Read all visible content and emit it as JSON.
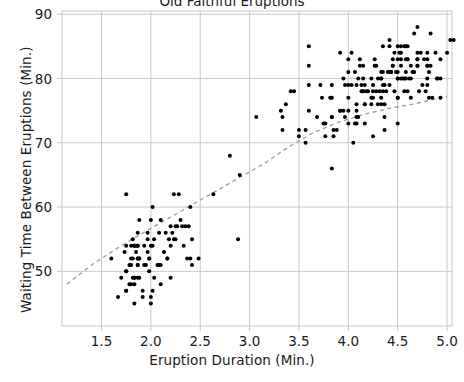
{
  "chart_data": {
    "type": "scatter",
    "title": "Old Faithful Eruptions",
    "xlabel": "Eruption Duration (Min.)",
    "ylabel": "Waiting Time Between Eruptions (Min.)",
    "xlim": [
      1.1,
      5.05
    ],
    "ylim": [
      41.5,
      90.5
    ],
    "xticks": [
      1.5,
      2.0,
      2.5,
      3.0,
      3.5,
      4.0,
      4.5,
      5.0
    ],
    "xticklabels": [
      "1.5",
      "2.0",
      "2.5",
      "3.0",
      "3.5",
      "4.0",
      "4.5",
      "5.0"
    ],
    "yticks": [
      50,
      60,
      70,
      80,
      90
    ],
    "yticklabels": [
      "50",
      "60",
      "70",
      "80",
      "90"
    ],
    "grid": true,
    "grid_color": "#c8c8c8",
    "legend": "none",
    "marker_color": "#000000",
    "marker_size": 4,
    "trend_line": {
      "style": "dashed",
      "color": "#9a9a9a",
      "points": [
        [
          1.15,
          48.0
        ],
        [
          1.4,
          51.0
        ],
        [
          1.65,
          53.5
        ],
        [
          1.9,
          55.8
        ],
        [
          2.15,
          58.0
        ],
        [
          2.4,
          60.2
        ],
        [
          2.65,
          62.4
        ],
        [
          2.9,
          64.6
        ],
        [
          3.15,
          66.8
        ],
        [
          3.4,
          69.4
        ],
        [
          3.65,
          71.6
        ],
        [
          3.9,
          73.2
        ],
        [
          4.15,
          74.4
        ],
        [
          4.4,
          75.3
        ],
        [
          4.65,
          76.0
        ],
        [
          5.0,
          77.2
        ]
      ]
    },
    "points": [
      [
        3.6,
        79
      ],
      [
        1.8,
        54
      ],
      [
        3.333,
        74
      ],
      [
        2.283,
        62
      ],
      [
        4.533,
        85
      ],
      [
        2.883,
        55
      ],
      [
        4.7,
        88
      ],
      [
        3.6,
        85
      ],
      [
        1.95,
        51
      ],
      [
        4.35,
        85
      ],
      [
        1.833,
        54
      ],
      [
        3.917,
        84
      ],
      [
        4.2,
        78
      ],
      [
        1.75,
        47
      ],
      [
        4.7,
        83
      ],
      [
        2.167,
        52
      ],
      [
        1.75,
        62
      ],
      [
        4.8,
        84
      ],
      [
        1.6,
        52
      ],
      [
        4.25,
        79
      ],
      [
        1.8,
        51
      ],
      [
        1.75,
        47
      ],
      [
        3.45,
        78
      ],
      [
        3.067,
        74
      ],
      [
        4.533,
        83
      ],
      [
        3.6,
        82
      ],
      [
        1.967,
        56
      ],
      [
        4.083,
        79
      ],
      [
        3.85,
        71
      ],
      [
        4.433,
        81
      ],
      [
        4.3,
        76
      ],
      [
        4.467,
        78
      ],
      [
        3.367,
        76
      ],
      [
        4.033,
        84
      ],
      [
        3.833,
        74
      ],
      [
        2.017,
        60
      ],
      [
        1.867,
        52
      ],
      [
        4.833,
        87
      ],
      [
        1.833,
        49
      ],
      [
        4.783,
        78
      ],
      [
        4.35,
        79
      ],
      [
        1.883,
        52
      ],
      [
        4.567,
        78
      ],
      [
        1.75,
        50
      ],
      [
        4.533,
        82
      ],
      [
        3.317,
        75
      ],
      [
        3.833,
        79
      ],
      [
        2.1,
        58
      ],
      [
        4.633,
        82
      ],
      [
        2.0,
        54
      ],
      [
        4.8,
        79
      ],
      [
        4.716,
        78
      ],
      [
        1.833,
        54
      ],
      [
        4.833,
        82
      ],
      [
        1.733,
        53
      ],
      [
        4.883,
        84
      ],
      [
        3.717,
        79
      ],
      [
        1.667,
        46
      ],
      [
        4.567,
        80
      ],
      [
        4.317,
        78
      ],
      [
        2.233,
        62
      ],
      [
        4.5,
        81
      ],
      [
        1.75,
        50
      ],
      [
        4.8,
        82
      ],
      [
        1.817,
        52
      ],
      [
        4.4,
        81
      ],
      [
        4.167,
        73
      ],
      [
        4.7,
        84
      ],
      [
        2.067,
        51
      ],
      [
        4.7,
        82
      ],
      [
        4.033,
        79
      ],
      [
        1.967,
        53
      ],
      [
        4.5,
        80
      ],
      [
        4.0,
        83
      ],
      [
        1.983,
        52
      ],
      [
        5.067,
        86
      ],
      [
        2.017,
        54
      ],
      [
        4.567,
        85
      ],
      [
        3.883,
        72
      ],
      [
        3.6,
        75
      ],
      [
        4.133,
        79
      ],
      [
        4.333,
        80
      ],
      [
        4.1,
        74
      ],
      [
        2.633,
        62
      ],
      [
        4.067,
        81
      ],
      [
        4.933,
        77
      ],
      [
        3.95,
        80
      ],
      [
        4.517,
        84
      ],
      [
        2.167,
        52
      ],
      [
        4.0,
        79
      ],
      [
        2.2,
        57
      ],
      [
        4.333,
        77
      ],
      [
        1.867,
        54
      ],
      [
        4.817,
        81
      ],
      [
        1.833,
        45
      ],
      [
        4.3,
        80
      ],
      [
        4.667,
        81
      ],
      [
        3.75,
        73
      ],
      [
        1.867,
        51
      ],
      [
        4.9,
        80
      ],
      [
        2.483,
        52
      ],
      [
        4.367,
        79
      ],
      [
        2.1,
        48
      ],
      [
        4.5,
        80
      ],
      [
        4.05,
        70
      ],
      [
        1.867,
        54
      ],
      [
        4.7,
        82
      ],
      [
        1.783,
        51
      ],
      [
        4.85,
        77
      ],
      [
        3.683,
        74
      ],
      [
        4.733,
        84
      ],
      [
        2.3,
        58
      ],
      [
        4.9,
        80
      ],
      [
        4.417,
        81
      ],
      [
        1.7,
        49
      ],
      [
        4.633,
        77
      ],
      [
        2.317,
        57
      ],
      [
        4.6,
        78
      ],
      [
        1.817,
        55
      ],
      [
        4.417,
        79
      ],
      [
        4.067,
        73
      ],
      [
        4.25,
        77
      ],
      [
        1.967,
        55
      ],
      [
        4.6,
        85
      ],
      [
        3.767,
        73
      ],
      [
        1.917,
        46
      ],
      [
        4.5,
        77
      ],
      [
        2.267,
        57
      ],
      [
        4.65,
        81
      ],
      [
        1.867,
        56
      ],
      [
        4.167,
        79
      ],
      [
        2.8,
        68
      ],
      [
        4.333,
        80
      ],
      [
        1.833,
        49
      ],
      [
        4.383,
        78
      ],
      [
        1.883,
        52
      ],
      [
        4.933,
        80
      ],
      [
        2.033,
        49
      ],
      [
        3.733,
        77
      ],
      [
        4.233,
        76
      ],
      [
        2.233,
        55
      ],
      [
        4.533,
        80
      ],
      [
        4.817,
        77
      ],
      [
        4.333,
        81
      ],
      [
        1.983,
        52
      ],
      [
        4.633,
        80
      ],
      [
        2.017,
        47
      ],
      [
        5.1,
        84
      ],
      [
        1.8,
        52
      ],
      [
        5.033,
        86
      ],
      [
        4.0,
        81
      ],
      [
        2.4,
        60
      ],
      [
        4.6,
        83
      ],
      [
        3.567,
        70
      ],
      [
        4.0,
        77
      ],
      [
        4.5,
        85
      ],
      [
        4.083,
        74
      ],
      [
        1.8,
        48
      ],
      [
        3.967,
        79
      ],
      [
        2.2,
        49
      ],
      [
        4.15,
        78
      ],
      [
        2.0,
        45
      ],
      [
        3.833,
        77
      ],
      [
        3.5,
        72
      ],
      [
        4.583,
        85
      ],
      [
        2.367,
        52
      ],
      [
        5.0,
        84
      ],
      [
        1.933,
        51
      ],
      [
        4.617,
        80
      ],
      [
        1.917,
        47
      ],
      [
        2.083,
        51
      ],
      [
        4.583,
        80
      ],
      [
        3.333,
        72
      ],
      [
        4.167,
        76
      ],
      [
        4.333,
        76
      ],
      [
        4.5,
        83
      ],
      [
        2.417,
        55
      ],
      [
        4.0,
        73
      ],
      [
        4.167,
        76
      ],
      [
        1.883,
        58
      ],
      [
        4.583,
        83
      ],
      [
        4.25,
        71
      ],
      [
        3.767,
        71
      ],
      [
        2.033,
        55
      ],
      [
        4.433,
        81
      ],
      [
        4.083,
        76
      ],
      [
        1.833,
        48
      ],
      [
        4.417,
        85
      ],
      [
        2.183,
        55
      ],
      [
        4.8,
        82
      ],
      [
        1.833,
        54
      ],
      [
        4.8,
        80
      ],
      [
        4.1,
        80
      ],
      [
        3.966,
        74
      ],
      [
        4.233,
        77
      ],
      [
        3.5,
        71
      ],
      [
        4.366,
        74
      ],
      [
        2.25,
        55
      ],
      [
        4.667,
        87
      ],
      [
        2.1,
        51
      ],
      [
        4.35,
        78
      ],
      [
        4.133,
        78
      ],
      [
        1.867,
        51
      ],
      [
        4.6,
        83
      ],
      [
        1.783,
        48
      ],
      [
        4.367,
        72
      ],
      [
        3.85,
        72
      ],
      [
        1.933,
        54
      ],
      [
        4.5,
        73
      ],
      [
        2.383,
        57
      ],
      [
        4.7,
        83
      ],
      [
        1.867,
        52
      ],
      [
        3.833,
        66
      ],
      [
        3.417,
        78
      ],
      [
        4.233,
        80
      ],
      [
        2.4,
        52
      ],
      [
        4.8,
        83
      ],
      [
        2.0,
        58
      ],
      [
        4.15,
        82
      ],
      [
        1.867,
        49
      ],
      [
        4.267,
        82
      ],
      [
        1.75,
        54
      ],
      [
        4.483,
        81
      ],
      [
        4.0,
        75
      ],
      [
        4.117,
        83
      ],
      [
        4.083,
        73
      ],
      [
        4.267,
        83
      ],
      [
        3.917,
        75
      ],
      [
        4.55,
        80
      ],
      [
        4.083,
        75
      ],
      [
        2.417,
        51
      ],
      [
        4.183,
        78
      ],
      [
        2.217,
        56
      ],
      [
        4.45,
        82
      ],
      [
        1.883,
        49
      ],
      [
        1.85,
        54
      ],
      [
        4.283,
        78
      ],
      [
        3.95,
        75
      ],
      [
        2.333,
        54
      ],
      [
        4.15,
        80
      ],
      [
        2.35,
        57
      ],
      [
        4.933,
        83
      ],
      [
        2.9,
        65
      ],
      [
        4.583,
        81
      ],
      [
        3.833,
        74
      ],
      [
        2.083,
        56
      ],
      [
        4.367,
        76
      ],
      [
        2.133,
        53
      ],
      [
        4.35,
        81
      ],
      [
        2.2,
        54
      ],
      [
        4.45,
        82
      ],
      [
        3.567,
        72
      ],
      [
        4.5,
        77
      ],
      [
        4.15,
        78
      ],
      [
        3.817,
        77
      ],
      [
        3.917,
        75
      ],
      [
        4.45,
        83
      ],
      [
        2.0,
        46
      ],
      [
        4.283,
        82
      ],
      [
        4.767,
        83
      ],
      [
        4.533,
        84
      ],
      [
        1.85,
        53
      ],
      [
        4.25,
        78
      ],
      [
        1.983,
        50
      ],
      [
        2.25,
        57
      ],
      [
        4.75,
        79
      ],
      [
        4.117,
        82
      ],
      [
        2.15,
        56
      ],
      [
        4.417,
        86
      ],
      [
        1.817,
        49
      ],
      [
        4.467,
        84
      ]
    ]
  }
}
